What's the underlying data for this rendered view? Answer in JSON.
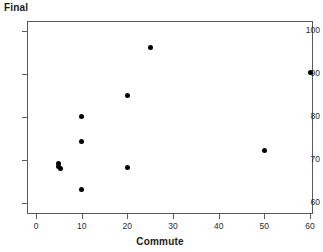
{
  "chart_data": {
    "type": "scatter",
    "title": "",
    "xlabel": "Commute",
    "ylabel": "Final",
    "xlim": [
      -2,
      62.5
    ],
    "ylim": [
      57.5,
      101.5
    ],
    "xticks": [
      0,
      10,
      20,
      30,
      40,
      50,
      60
    ],
    "yticks": [
      60,
      70,
      80,
      90,
      100
    ],
    "xtick_labels": [
      "0",
      "10",
      "20",
      "30",
      "40",
      "50",
      "60"
    ],
    "ytick_labels": [
      "60",
      "70",
      "80",
      "90",
      "100"
    ],
    "grid": false,
    "legend": null,
    "marker_color": "#000000",
    "frame_color": "#5a5a5a",
    "background_color": "#ffffff",
    "points": [
      {
        "x": 5,
        "y": 69.3
      },
      {
        "x": 5,
        "y": 68.4
      },
      {
        "x": 5.4,
        "y": 68.1
      },
      {
        "x": 10,
        "y": 80.1
      },
      {
        "x": 10,
        "y": 74.2
      },
      {
        "x": 10,
        "y": 63.1
      },
      {
        "x": 20,
        "y": 85.1
      },
      {
        "x": 20,
        "y": 68.2
      },
      {
        "x": 25,
        "y": 96.1
      },
      {
        "x": 50,
        "y": 72.1
      },
      {
        "x": 60,
        "y": 90.3
      }
    ]
  }
}
